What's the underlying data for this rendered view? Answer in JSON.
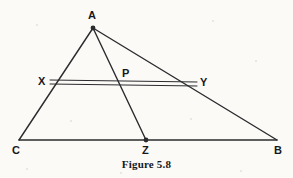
{
  "figure": {
    "caption": "Figure 5.8",
    "caption_pos": {
      "y": 158
    },
    "background_color": "#fbfaf7",
    "stroke_color": "#2b2b2e",
    "label_color": "#17171a",
    "canvas": {
      "width": 293,
      "height": 178
    },
    "points": {
      "A": {
        "x": 93,
        "y": 28,
        "label": "A",
        "label_x": 88,
        "label_y": 10,
        "dot": true
      },
      "B": {
        "x": 277,
        "y": 140,
        "label": "B",
        "label_x": 274,
        "label_y": 145,
        "dot": false
      },
      "C": {
        "x": 19,
        "y": 140,
        "label": "C",
        "label_x": 12,
        "label_y": 145,
        "dot": false
      },
      "X": {
        "x": 50,
        "y": 82,
        "label": "X",
        "label_x": 38,
        "label_y": 76,
        "dot": false
      },
      "Y": {
        "x": 197,
        "y": 84,
        "label": "Y",
        "label_x": 200,
        "label_y": 77,
        "dot": false
      },
      "P": {
        "x": 126,
        "y": 83,
        "label": "P",
        "label_x": 122,
        "label_y": 68,
        "dot": false
      },
      "Z": {
        "x": 146,
        "y": 140,
        "label": "Z",
        "label_x": 142,
        "label_y": 145,
        "dot": true
      }
    },
    "segments": [
      {
        "name": "side-CA",
        "from": "C",
        "to": "A",
        "width": 1.4
      },
      {
        "name": "side-AB",
        "from": "A",
        "to": "B",
        "width": 1.4
      },
      {
        "name": "base-CB",
        "from": "C",
        "to": "B",
        "width": 1.4
      },
      {
        "name": "cevian-AZ",
        "from": "A",
        "to": "Z",
        "width": 1.4
      },
      {
        "name": "segment-XY-upper",
        "from": "X",
        "to": "Y",
        "width": 1.0,
        "offset_from": -2,
        "offset_to": -2
      },
      {
        "name": "segment-XY-lower",
        "from": "X",
        "to": "Y",
        "width": 1.0,
        "offset_from": 2,
        "offset_to": 2
      }
    ],
    "specks": [
      {
        "x": 36,
        "y": 24,
        "s": 2
      },
      {
        "x": 212,
        "y": 20,
        "s": 2
      },
      {
        "x": 255,
        "y": 60,
        "s": 2
      },
      {
        "x": 70,
        "y": 120,
        "s": 2
      },
      {
        "x": 190,
        "y": 118,
        "s": 2
      },
      {
        "x": 26,
        "y": 168,
        "s": 2
      },
      {
        "x": 240,
        "y": 170,
        "s": 2
      },
      {
        "x": 120,
        "y": 172,
        "s": 2
      }
    ]
  }
}
